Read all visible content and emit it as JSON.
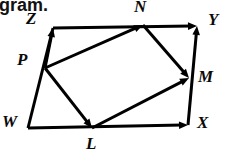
{
  "page": {
    "background_color": "#ffffff",
    "ink_color": "#000000",
    "width": 230,
    "height": 161,
    "clipped_caption": "gram."
  },
  "diagram": {
    "type": "geometry-parallelogram-vector-diagram",
    "outer_quadrilateral": [
      "W",
      "Z",
      "Y",
      "X"
    ],
    "inner_quadrilateral": [
      "P",
      "N",
      "M",
      "L"
    ],
    "vertices": [
      {
        "id": "W",
        "label": "W",
        "x": 28,
        "y": 128,
        "label_x": 2,
        "label_y": 113
      },
      {
        "id": "Z",
        "label": "Z",
        "x": 53,
        "y": 28,
        "label_x": 26,
        "label_y": 10
      },
      {
        "id": "Y",
        "label": "Y",
        "x": 197,
        "y": 26,
        "label_x": 208,
        "label_y": 11
      },
      {
        "id": "X",
        "label": "X",
        "x": 188,
        "y": 125,
        "label_x": 197,
        "label_y": 114
      },
      {
        "id": "P",
        "label": "P",
        "x": 45,
        "y": 68,
        "label_x": 17,
        "label_y": 51
      },
      {
        "id": "N",
        "label": "N",
        "x": 143,
        "y": 25,
        "label_x": 134,
        "label_y": -2
      },
      {
        "id": "M",
        "label": "M",
        "x": 189,
        "y": 78,
        "label_x": 198,
        "label_y": 68
      },
      {
        "id": "L",
        "label": "L",
        "x": 92,
        "y": 128,
        "label_x": 86,
        "label_y": 135
      }
    ],
    "segments": [
      {
        "name": "edge-W-Z",
        "from": "W",
        "to": "Z",
        "arrow": false
      },
      {
        "name": "edge-Z-Y",
        "from": "Z",
        "to": "Y",
        "arrow": true
      },
      {
        "name": "edge-W-X",
        "from": "W",
        "to": "X",
        "arrow": true
      },
      {
        "name": "edge-X-Y",
        "from": "X",
        "to": "Y",
        "arrow": true
      },
      {
        "name": "vector-P-Z",
        "from": "P",
        "to": "Z",
        "arrow": true
      },
      {
        "name": "vector-P-N",
        "from": "P",
        "to": "N",
        "arrow": true
      },
      {
        "name": "vector-N-M",
        "from": "N",
        "to": "M",
        "arrow": true
      },
      {
        "name": "vector-P-L",
        "from": "P",
        "to": "L",
        "arrow": true
      },
      {
        "name": "vector-L-M",
        "from": "L",
        "to": "M",
        "arrow": true
      }
    ],
    "stroke_width": 3,
    "arrow_size": 9
  }
}
